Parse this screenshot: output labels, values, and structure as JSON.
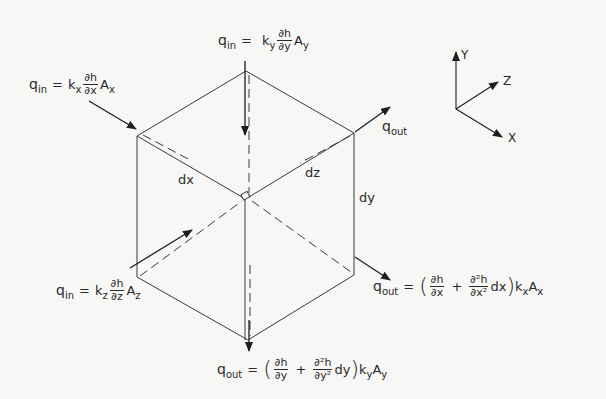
{
  "diagram": {
    "axes": {
      "y": "Y",
      "z": "Z",
      "x": "X"
    },
    "edge_labels": {
      "dx": "dx",
      "dz": "dz",
      "dy": "dy"
    },
    "flows": {
      "qin_x": {
        "q": "q",
        "q_sub": "in",
        "eq": "=",
        "k": "k",
        "k_sub": "x",
        "num": "∂h",
        "den": "∂x",
        "A": "A",
        "A_sub": "x"
      },
      "qin_y": {
        "q": "q",
        "q_sub": "in",
        "eq": "=",
        "k": "k",
        "k_sub": "y",
        "num": "∂h",
        "den": "∂y",
        "A": "A",
        "A_sub": "y"
      },
      "qin_z": {
        "q": "q",
        "q_sub": "in",
        "eq": "=",
        "k": "k",
        "k_sub": "z",
        "num": "∂h",
        "den": "∂z",
        "A": "A",
        "A_sub": "z"
      },
      "qout_z": {
        "q": "q",
        "q_sub": "out"
      },
      "qout_x": {
        "q": "q",
        "q_sub": "out",
        "eq": "=",
        "open": "(",
        "num1": "∂h",
        "den1": "∂x",
        "plus": "+",
        "num2": "∂²h",
        "den2": "∂x²",
        "d": "dx",
        "close": ")",
        "k": "k",
        "k_sub": "x",
        "A": "A",
        "A_sub": "x"
      },
      "qout_y": {
        "q": "q",
        "q_sub": "out",
        "eq": "=",
        "open": "(",
        "num1": "∂h",
        "den1": "∂y",
        "plus": "+",
        "num2": "∂²h",
        "den2": "∂y²",
        "d": "dy",
        "close": ")",
        "k": "k",
        "k_sub": "y",
        "A": "A",
        "A_sub": "y"
      }
    }
  }
}
